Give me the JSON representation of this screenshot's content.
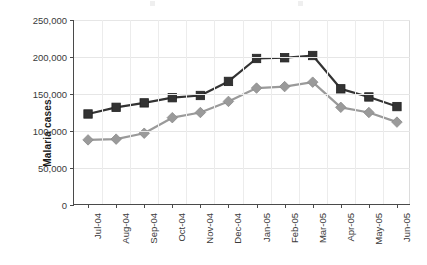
{
  "chart_data": {
    "type": "line",
    "title": "",
    "xlabel": "",
    "ylabel": "Malaria cases",
    "ylim": [
      0,
      250000
    ],
    "yticks": [
      0,
      50000,
      100000,
      150000,
      200000,
      250000
    ],
    "ytick_labels": [
      "0",
      "50,000",
      "100,000",
      "150,000",
      "200,000",
      "250,000"
    ],
    "grid": true,
    "legend": "none",
    "categories": [
      "Jul-04",
      "Aug-04",
      "Sep-04",
      "Oct-04",
      "Nov-04",
      "Dec-04",
      "Jan-05",
      "Feb-05",
      "Mar-05",
      "Apr-05",
      "May-05",
      "Jun-05"
    ],
    "series": [
      {
        "name": "upper-series",
        "marker": "square",
        "color": "#333333",
        "values": [
          123000,
          132000,
          138000,
          145000,
          148000,
          167000,
          198000,
          199000,
          202000,
          157000,
          146000,
          133000
        ]
      },
      {
        "name": "lower-series",
        "marker": "diamond",
        "color": "#9a9a9a",
        "values": [
          88000,
          89000,
          97000,
          118000,
          125000,
          140000,
          158000,
          160000,
          166000,
          132000,
          125000,
          112000
        ]
      }
    ]
  },
  "legend_strip": {
    "entries": [
      "",
      ""
    ]
  },
  "colors": {
    "axis": "#4a4a4a",
    "grid": "#e6e6e6",
    "series_dark": "#333333",
    "series_light": "#9a9a9a",
    "background": "#ffffff"
  }
}
